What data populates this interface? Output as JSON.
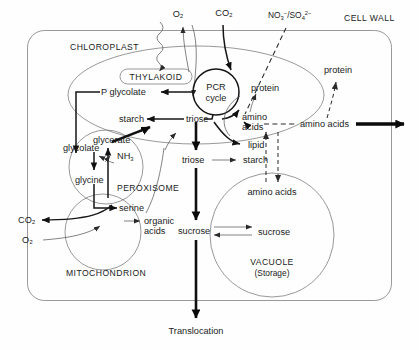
{
  "figure": {
    "type": "biological-pathway-diagram"
  },
  "compartments": {
    "cell_wall": "CELL WALL",
    "chloroplast": "CHLOROPLAST",
    "thylakoid": "THYLAKOID",
    "peroxisome": "PEROXISOME",
    "mitochondrion": "MITOCHONDRION",
    "vacuole": "VACUOLE",
    "vacuole_sub": "(Storage)"
  },
  "inputs": {
    "o2_top": "O₂",
    "co2_top": "CO₂",
    "nitrate_sulfate_main": "NO",
    "nitrate_sulfate_sub1": "3",
    "nitrate_sulfate_sup1": "−",
    "nitrate_sulfate_slash": "/SO",
    "nitrate_sulfate_sub2": "4",
    "nitrate_sulfate_sup2": "2−",
    "co2_left": "CO₂",
    "o2_left": "O₂"
  },
  "metabolites": {
    "pcr_cycle_line1": "PCR",
    "pcr_cycle_line2": "cycle",
    "p_glycolate": "P glycolate",
    "starch_chloroplast": "starch",
    "triose_chloroplast": "triose",
    "protein_chloroplast": "protein",
    "amino_acids_line1": "amino",
    "amino_acids_line2": "acids",
    "lipid": "lipid",
    "triose_cytosol": "triose",
    "starch_cytosol": "starch",
    "sucrose_cytosol": "sucrose",
    "glycolate": "glycolate",
    "glycerate": "glycerate",
    "glycine": "glycine",
    "nh3": "NH",
    "nh3_sub": "3",
    "serine": "serine",
    "organic_acids_line1": "organic",
    "organic_acids_line2": "acids",
    "amino_acids_cytosol": "amino acids",
    "amino_acids_vacuole": "amino acids",
    "protein_cytosol": "protein",
    "sucrose_vacuole": "sucrose"
  },
  "outputs": {
    "translocation": "Translocation"
  },
  "colors": {
    "ink": "#101010",
    "membrane": "#6d6d6d",
    "background": "#fefefe"
  }
}
